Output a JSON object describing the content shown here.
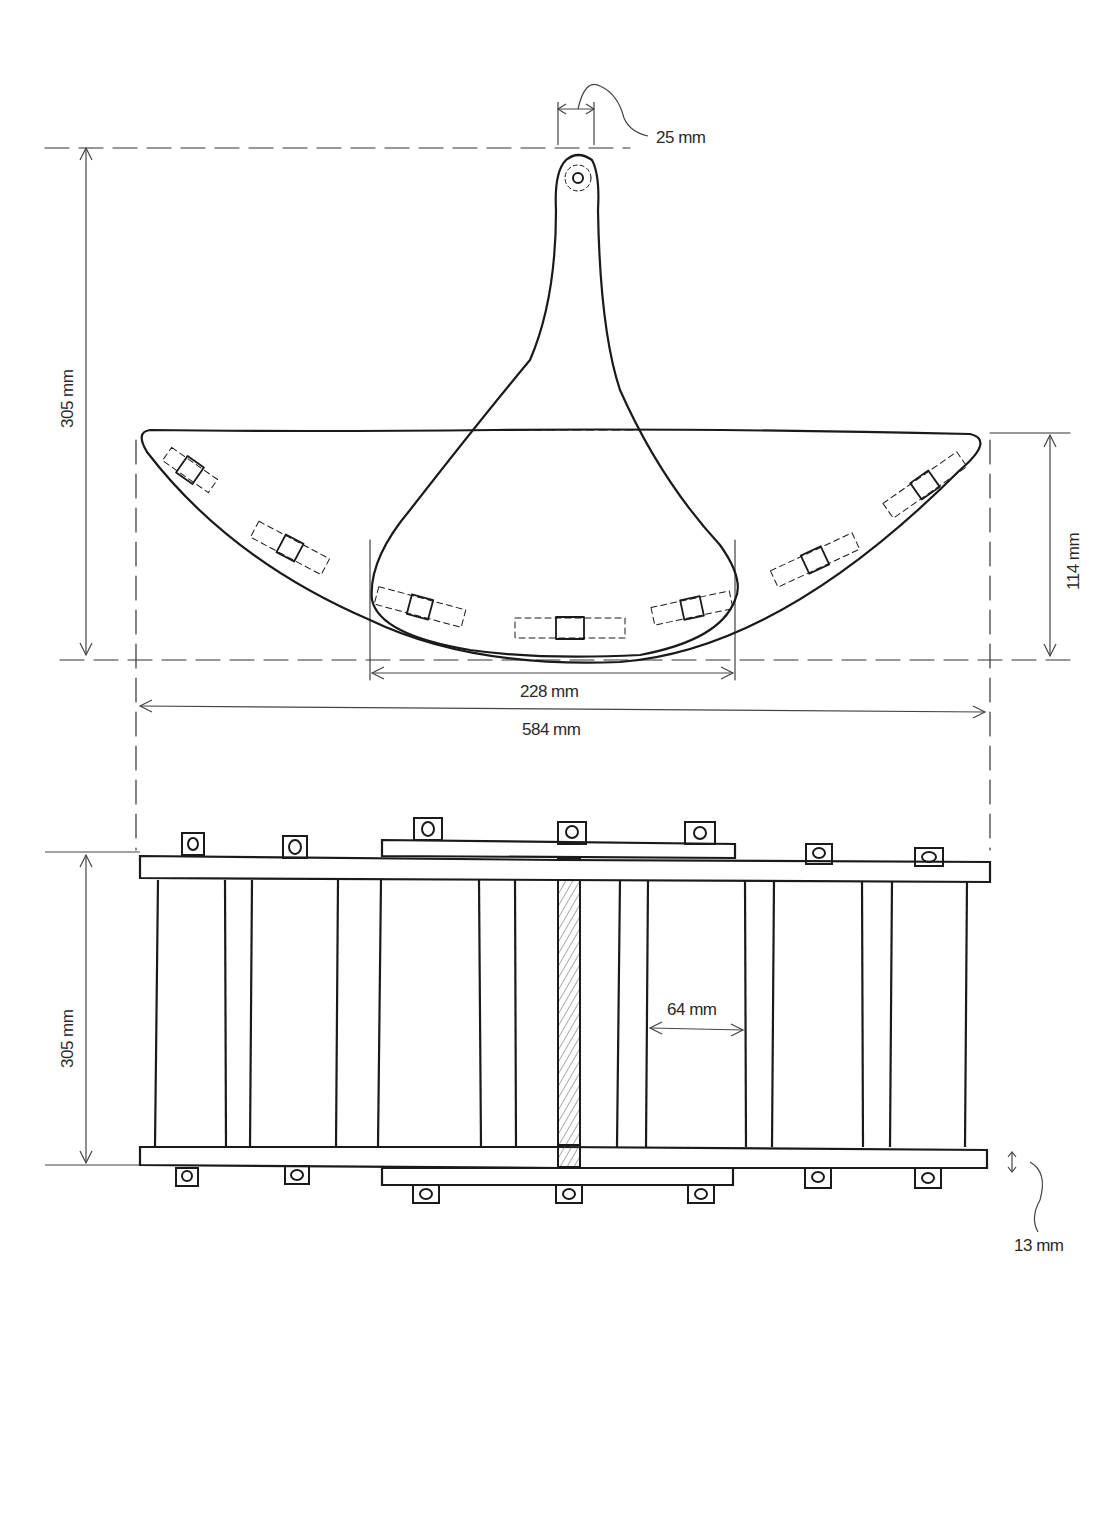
{
  "diagram": {
    "type": "technical-sketch",
    "views": [
      "side-view",
      "top-view"
    ],
    "line_color": "#1a1a1a",
    "dimension_color": "#444444",
    "hatch_color": "#555555"
  },
  "dimensions": {
    "handle_width": "25 mm",
    "total_height_side": "305 mm",
    "wing_height": "114 mm",
    "base_width": "228 mm",
    "total_width": "584 mm",
    "top_view_depth": "305 mm",
    "slat_gap": "64 mm",
    "rail_thickness": "13 mm"
  }
}
